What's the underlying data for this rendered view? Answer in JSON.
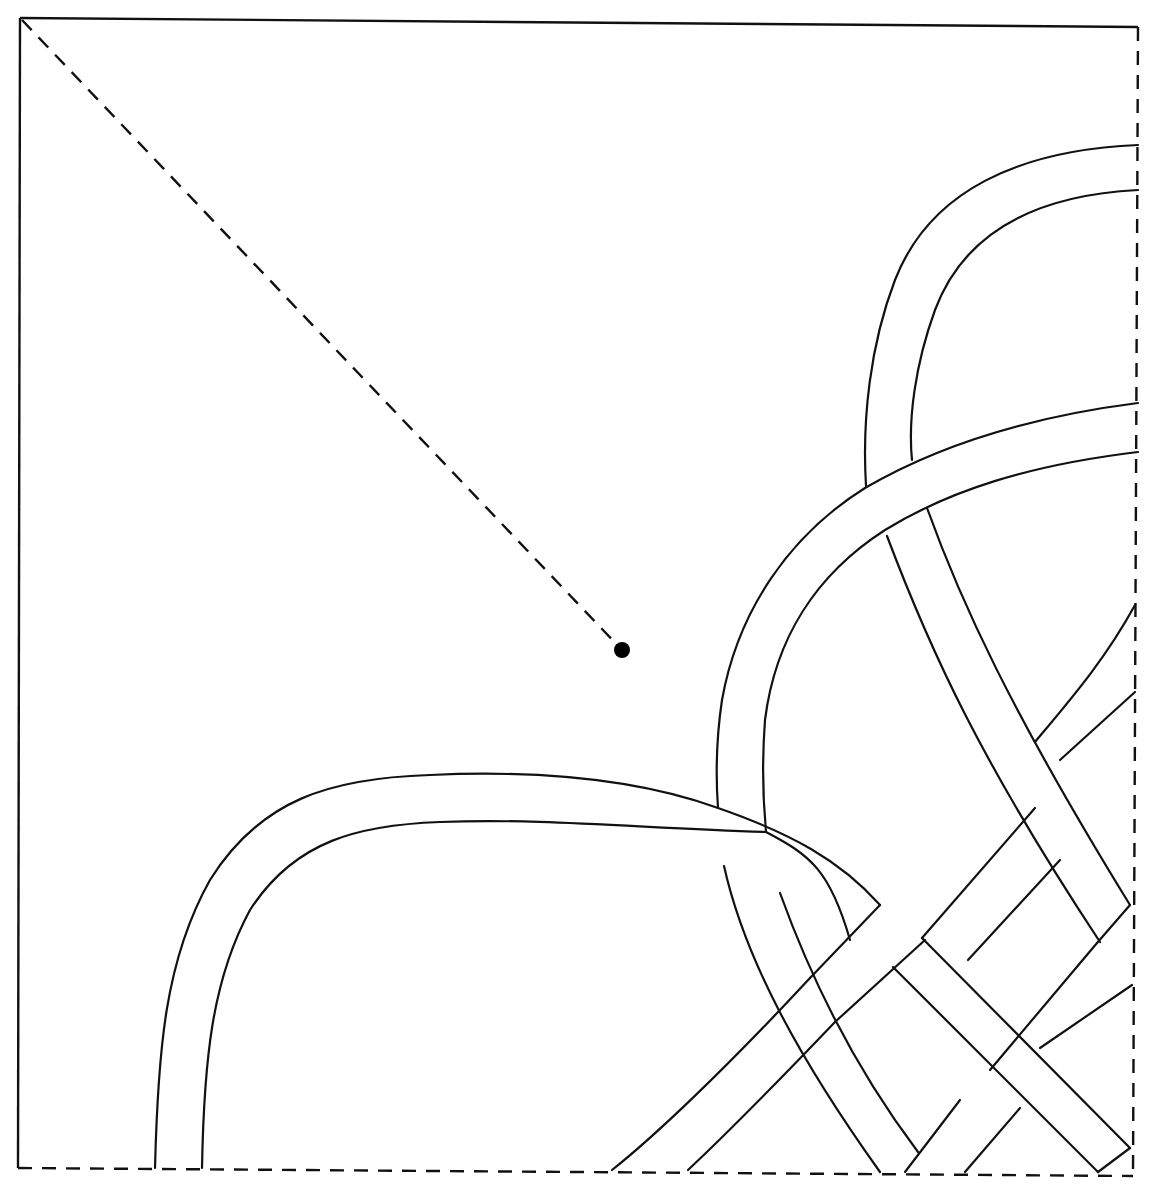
{
  "diagram": {
    "type": "interlace-knotwork-quarter-tile",
    "width": 1155,
    "height": 1190,
    "colors": {
      "stroke": "#111111",
      "background": "#ffffff",
      "dot": "#000000"
    },
    "frame": {
      "solid_edges": [
        {
          "name": "top-edge",
          "d": "M20,18 L1138,27"
        },
        {
          "name": "left-edge",
          "d": "M20,18 L18,1168"
        }
      ],
      "dashed_edges": [
        {
          "name": "right-edge",
          "d": "M1138,27 L1133,1176"
        },
        {
          "name": "bottom-edge",
          "d": "M18,1168 L1133,1176"
        }
      ]
    },
    "diagonal": {
      "name": "center-diagonal",
      "d": "M22,20 L622,650"
    },
    "center_point": {
      "cx": 622,
      "cy": 650,
      "r": 8
    },
    "strands": [
      {
        "name": "band-a-outer-upper",
        "d": "M1138,145 C1020,150 930,190 895,280 C870,345 862,420 866,486"
      },
      {
        "name": "band-a-inner-upper",
        "d": "M1138,190 C1040,195 965,230 935,310 C915,365 908,420 912,460"
      },
      {
        "name": "band-a-outer-lower",
        "d": "M887,536 C930,650 980,760 1100,942"
      },
      {
        "name": "band-a-inner-lower",
        "d": "M927,508 C960,600 1010,710 1130,905"
      },
      {
        "name": "band-b-outer-upper",
        "d": "M1138,403 C1020,418 930,450 865,488 C790,535 738,610 722,700 C716,740 716,780 718,808"
      },
      {
        "name": "band-b-inner-upper",
        "d": "M1138,452 C1030,465 950,490 885,530 C815,575 775,640 765,720 C762,760 763,800 766,832"
      },
      {
        "name": "band-b-outer-lower",
        "d": "M724,866 C745,960 800,1060 880,1172"
      },
      {
        "name": "band-b-inner-lower",
        "d": "M780,893 C815,990 860,1075 918,1152"
      },
      {
        "name": "band-c-outer",
        "d": "M155,1168 C158,1050 165,960 210,880 C260,800 330,778 430,775 C540,770 640,780 718,808 C790,833 840,860 880,905"
      },
      {
        "name": "band-c-inner",
        "d": "M202,1168 C204,1060 212,980 250,910 C295,840 360,825 440,822 C540,818 640,828 766,832 C810,855 830,870 850,940"
      },
      {
        "name": "band-c-outer-diag",
        "d": "M922,938 L1130,1148"
      },
      {
        "name": "band-c-inner-diag",
        "d": "M893,967 L1098,1172"
      },
      {
        "name": "band-c-end-cap",
        "d": "M1098,1172 L1130,1148"
      },
      {
        "name": "band-d-outer-lower",
        "d": "M612,1170 C650,1140 720,1075 810,978"
      },
      {
        "name": "band-d-inner-lower",
        "d": "M688,1170 C720,1140 770,1090 835,1022"
      },
      {
        "name": "band-d-outer-mid",
        "d": "M810,978 L880,905"
      },
      {
        "name": "band-d-inner-mid",
        "d": "M835,1022 L925,940"
      },
      {
        "name": "band-d-outer-upper",
        "d": "M922,938 L1035,808"
      },
      {
        "name": "band-d-inner-upper",
        "d": "M968,960 L1060,860"
      },
      {
        "name": "band-d-outer-end",
        "d": "M1035,742 C1070,700 1105,660 1135,605"
      },
      {
        "name": "band-d-inner-end",
        "d": "M1060,760 L1135,692"
      },
      {
        "name": "band-e-outer",
        "d": "M905,1172 L960,1100"
      },
      {
        "name": "band-e-inner",
        "d": "M965,1172 L1020,1108"
      },
      {
        "name": "band-e-mid-outer",
        "d": "M990,1070 L1097,943"
      },
      {
        "name": "band-e-mid-inner",
        "d": "M1040,1048 L1132,985"
      },
      {
        "name": "band-e-end-cap",
        "d": "M1097,943 L1130,905"
      }
    ]
  }
}
